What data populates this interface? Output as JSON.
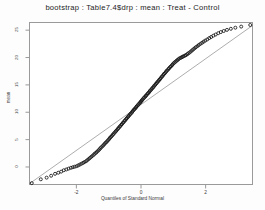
{
  "window": {
    "app": "S-PLUS Graph Window",
    "background_color": "#fdfdfd"
  },
  "chart_data": {
    "type": "scatter",
    "title": "bootstrap : Table7.4$drp : mean : Treat - Control",
    "subtitle": "",
    "xlabel": "Quantiles of Standard Normal",
    "ylabel": "mean",
    "xlim": [
      -3.45,
      3.45
    ],
    "ylim": [
      -3.2,
      26.4
    ],
    "xticks": [
      -2,
      0,
      2
    ],
    "xticklabels": [
      "-2",
      "0",
      "2"
    ],
    "yticks": [
      0,
      5,
      10,
      15,
      20,
      25
    ],
    "yticklabels": [
      "0",
      "5",
      "10",
      "15",
      "20",
      "25"
    ],
    "grid": false,
    "legend": null,
    "marker": "open-circle",
    "marker_color": "#171717",
    "line_color": "#8a8a8a",
    "reference_line": {
      "name": "qq-reference-line",
      "style": "solid-thin",
      "p1": [
        -3.45,
        -3.05
      ],
      "p2": [
        3.45,
        25.85
      ]
    },
    "series": [
      {
        "name": "bootstrap-replicates",
        "x": [
          -3.38,
          -3.1,
          -2.92,
          -2.78,
          -2.66,
          -2.56,
          -2.47,
          -2.39,
          -2.31,
          -2.24,
          -2.17,
          -2.11,
          -2.05,
          -1.99,
          -1.94,
          -1.89,
          -1.84,
          -1.79,
          -1.75,
          -1.7,
          -1.66,
          -1.62,
          -1.58,
          -1.54,
          -1.5,
          -1.46,
          -1.43,
          -1.39,
          -1.36,
          -1.32,
          -1.29,
          -1.26,
          -1.23,
          -1.19,
          -1.16,
          -1.13,
          -1.1,
          -1.07,
          -1.04,
          -1.01,
          -0.98,
          -0.96,
          -0.93,
          -0.9,
          -0.87,
          -0.85,
          -0.82,
          -0.79,
          -0.77,
          -0.74,
          -0.71,
          -0.69,
          -0.66,
          -0.64,
          -0.61,
          -0.59,
          -0.56,
          -0.54,
          -0.51,
          -0.49,
          -0.46,
          -0.44,
          -0.41,
          -0.39,
          -0.37,
          -0.34,
          -0.32,
          -0.29,
          -0.27,
          -0.25,
          -0.22,
          -0.2,
          -0.17,
          -0.15,
          -0.13,
          -0.1,
          -0.08,
          -0.05,
          -0.03,
          -0.01,
          0.01,
          0.03,
          0.05,
          0.08,
          0.1,
          0.13,
          0.15,
          0.17,
          0.2,
          0.22,
          0.25,
          0.27,
          0.29,
          0.32,
          0.34,
          0.37,
          0.39,
          0.41,
          0.44,
          0.46,
          0.49,
          0.51,
          0.54,
          0.56,
          0.59,
          0.61,
          0.64,
          0.66,
          0.69,
          0.71,
          0.74,
          0.77,
          0.79,
          0.82,
          0.85,
          0.87,
          0.9,
          0.93,
          0.96,
          0.98,
          1.01,
          1.04,
          1.07,
          1.1,
          1.13,
          1.16,
          1.19,
          1.23,
          1.26,
          1.29,
          1.32,
          1.36,
          1.39,
          1.43,
          1.46,
          1.5,
          1.54,
          1.58,
          1.62,
          1.66,
          1.7,
          1.75,
          1.79,
          1.84,
          1.89,
          1.94,
          1.99,
          2.05,
          2.11,
          2.17,
          2.24,
          2.31,
          2.39,
          2.47,
          2.56,
          2.66,
          2.78,
          2.92,
          3.1,
          3.38
        ],
        "y": [
          -2.95,
          -2.25,
          -1.95,
          -1.6,
          -1.25,
          -1.05,
          -0.85,
          -0.6,
          -0.45,
          -0.3,
          -0.15,
          -0.05,
          0.05,
          0.15,
          0.3,
          0.45,
          0.6,
          0.75,
          0.9,
          1.05,
          1.25,
          1.45,
          1.65,
          1.85,
          2.05,
          2.25,
          2.45,
          2.6,
          2.8,
          3.0,
          3.2,
          3.4,
          3.6,
          3.8,
          4.0,
          4.2,
          4.4,
          4.55,
          4.75,
          4.95,
          5.15,
          5.35,
          5.5,
          5.7,
          5.9,
          6.05,
          6.25,
          6.45,
          6.6,
          6.8,
          7.0,
          7.15,
          7.35,
          7.5,
          7.7,
          7.85,
          8.05,
          8.2,
          8.4,
          8.55,
          8.75,
          8.9,
          9.1,
          9.25,
          9.4,
          9.6,
          9.75,
          9.9,
          10.1,
          10.25,
          10.45,
          10.6,
          10.75,
          10.95,
          11.1,
          11.25,
          11.45,
          11.6,
          11.75,
          11.9,
          12.05,
          12.2,
          12.35,
          12.55,
          12.7,
          12.85,
          13.0,
          13.15,
          13.35,
          13.5,
          13.65,
          13.85,
          14.0,
          14.15,
          14.35,
          14.5,
          14.65,
          14.85,
          15.0,
          15.2,
          15.35,
          15.55,
          15.7,
          15.9,
          16.05,
          16.25,
          16.45,
          16.6,
          16.8,
          17.0,
          17.15,
          17.35,
          17.55,
          17.7,
          17.9,
          18.05,
          18.25,
          18.4,
          18.6,
          18.75,
          18.95,
          19.1,
          19.25,
          19.4,
          19.55,
          19.7,
          19.85,
          19.95,
          20.05,
          20.15,
          20.25,
          20.35,
          20.45,
          20.6,
          20.75,
          20.9,
          21.1,
          21.3,
          21.5,
          21.7,
          21.9,
          22.1,
          22.3,
          22.5,
          22.7,
          22.9,
          23.1,
          23.3,
          23.55,
          23.75,
          24.0,
          24.2,
          24.45,
          24.65,
          24.85,
          25.05,
          25.25,
          25.45,
          25.65,
          25.95
        ]
      }
    ]
  }
}
